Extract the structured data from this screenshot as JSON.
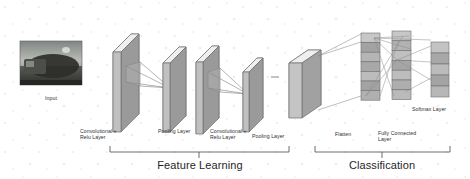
{
  "figure": {
    "background": "#ffffff"
  },
  "colors": {
    "block_front": "#c9c9c9",
    "block_side": "#8f8f8f",
    "block_top": "#e3e3e3",
    "block_stroke": "#6e6e6e",
    "cell_light": "#c2c2c2",
    "cell_dark": "#9b9b9b",
    "line": "#7a7a7a",
    "bracket": "#4a4a4a",
    "text": "#303030",
    "heading": "#1f1f1f"
  },
  "input": {
    "label": "Input",
    "description": "grayscale photograph thumbnail"
  },
  "stages": [
    {
      "id": "conv1",
      "label": "Convolutional +\nRelu Layer",
      "kind": "slab"
    },
    {
      "id": "pool1",
      "label": "Pooling Layer",
      "kind": "slab"
    },
    {
      "id": "conv2",
      "label": "Convolutional +\nRelu Layer",
      "kind": "slab"
    },
    {
      "id": "pool2",
      "label": "Pooling Layer",
      "kind": "slab"
    },
    {
      "id": "flatten",
      "label": "Flatten",
      "kind": "bar"
    },
    {
      "id": "fc",
      "label": "Fully Connected\nLayer",
      "kind": "column"
    },
    {
      "id": "softmax",
      "label": "Softmax Layer",
      "kind": "column"
    }
  ],
  "sections": [
    {
      "id": "feature-learning",
      "label": "Feature Learning"
    },
    {
      "id": "classification",
      "label": "Classification"
    }
  ],
  "layers_detail": {
    "fc_column_cells": 7,
    "fc_column2_cells": 7,
    "softmax_cells": 5
  }
}
